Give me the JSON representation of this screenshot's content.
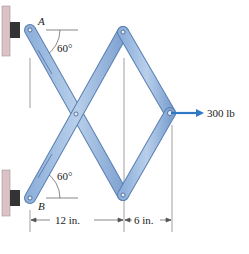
{
  "figure": {
    "labels": {
      "pin_a": "A",
      "pin_b": "B",
      "angle_top": "60°",
      "angle_bottom": "60°",
      "force": "300 lb",
      "dim_left": "12 in.",
      "dim_right": "6 in."
    },
    "colors": {
      "member_fill": "#a9c3e3",
      "member_dark": "#6f95c6",
      "member_edge": "#5a7fb0",
      "force_arrow": "#2f78c8",
      "wall": "#d9c3c7",
      "bracket": "#333333",
      "dim_line": "#555555"
    }
  }
}
